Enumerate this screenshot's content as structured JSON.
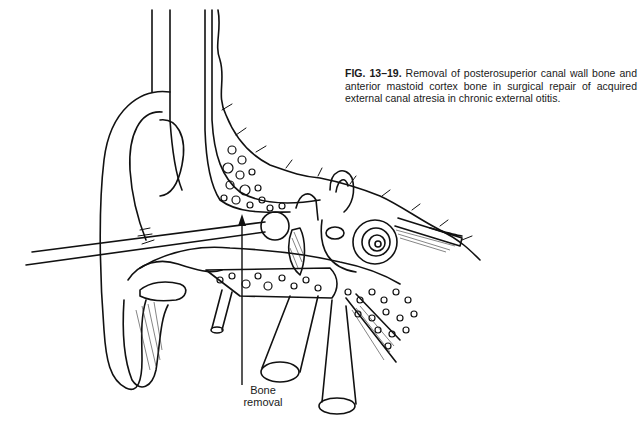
{
  "figure": {
    "caption": {
      "label": "FIG. 13–19.",
      "text": "Removal of posterosuperior canal wall bone and anterior mastoid cortex bone in surgical repair of acquired external canal atresia in chronic external otitis."
    },
    "annotations": [
      {
        "id": "bone-removal",
        "line1": "Bone",
        "line2": "removal"
      }
    ],
    "illustration": {
      "subject": "ear-cross-section",
      "colors": {
        "ink": "#111111",
        "paper": "#ffffff"
      }
    }
  }
}
